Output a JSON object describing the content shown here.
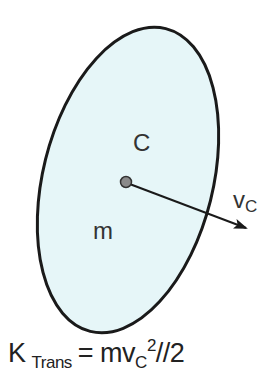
{
  "diagram": {
    "body": {
      "shape": "ellipse",
      "fill_color": "#e6f6f8",
      "stroke_color": "#1a1a1a",
      "center": [
        128,
        180
      ],
      "rx": 85,
      "ry": 156,
      "rotation_deg": 14
    },
    "labels": {
      "center_of_mass": "C",
      "mass": "m",
      "velocity": "v",
      "velocity_sub": "C"
    },
    "velocity_vector": {
      "from": [
        125,
        183
      ],
      "to": [
        248,
        228
      ],
      "color": "#1a1a1a"
    },
    "formula": {
      "lhs": "K",
      "lhs_sub": "Trans",
      "eq": "= mv",
      "v_sub": "C",
      "sup": "2",
      "tail": "//2"
    }
  }
}
